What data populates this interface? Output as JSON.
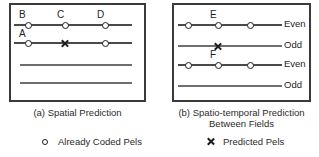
{
  "figure": {
    "colors": {
      "box_border": "#3a3a3a",
      "scanline": "#6e6e6e",
      "marker": "#1e1e1e",
      "text": "#2b2b2b",
      "background": "#ffffff"
    }
  },
  "panel_a": {
    "caption": "(a) Spatial Prediction",
    "scanlines": [
      {
        "id": "line-1",
        "x": 14,
        "y": 24,
        "width": 118
      },
      {
        "id": "line-2",
        "x": 14,
        "y": 42,
        "width": 118
      },
      {
        "id": "line-3",
        "x": 20,
        "y": 64,
        "width": 112
      },
      {
        "id": "line-4",
        "x": 20,
        "y": 82,
        "width": 112
      }
    ],
    "markers": [
      {
        "id": "marker-B",
        "type": "circle",
        "label": "B",
        "x": 25,
        "y": 25
      },
      {
        "id": "marker-C",
        "type": "circle",
        "label": "C",
        "x": 62,
        "y": 25
      },
      {
        "id": "marker-D",
        "type": "circle",
        "label": "D",
        "x": 102,
        "y": 25
      },
      {
        "id": "marker-A",
        "type": "circle",
        "label": "A",
        "x": 25,
        "y": 43
      },
      {
        "id": "marker-X",
        "type": "cross",
        "label": "",
        "x": 62,
        "y": 43
      },
      {
        "id": "marker-right",
        "type": "circle",
        "label": "",
        "x": 102,
        "y": 43
      }
    ]
  },
  "panel_b": {
    "caption": "(b) Spatio-temporal Prediction\nBetween Fields",
    "scanlines": [
      {
        "id": "line-1",
        "x": 178,
        "y": 24,
        "width": 104,
        "parity": "Even"
      },
      {
        "id": "line-2",
        "x": 178,
        "y": 45,
        "width": 104,
        "parity": "Odd"
      },
      {
        "id": "line-3",
        "x": 178,
        "y": 64,
        "width": 104,
        "parity": "Even"
      },
      {
        "id": "line-4",
        "x": 178,
        "y": 85,
        "width": 104,
        "parity": "Odd"
      }
    ],
    "field_labels": [
      {
        "id": "field-1",
        "text": "Even",
        "x": 285,
        "y": 19
      },
      {
        "id": "field-2",
        "text": "Odd",
        "x": 285,
        "y": 40
      },
      {
        "id": "field-3",
        "text": "Even",
        "x": 285,
        "y": 59
      },
      {
        "id": "field-4",
        "text": "Odd",
        "x": 285,
        "y": 80
      }
    ],
    "markers": [
      {
        "id": "marker-b1",
        "type": "circle",
        "label": "",
        "x": 188,
        "y": 25
      },
      {
        "id": "marker-E",
        "type": "circle",
        "label": "E",
        "x": 218,
        "y": 25
      },
      {
        "id": "marker-b3",
        "type": "circle",
        "label": "",
        "x": 250,
        "y": 25
      },
      {
        "id": "marker-X",
        "type": "cross",
        "label": "",
        "x": 218,
        "y": 46
      },
      {
        "id": "marker-b4",
        "type": "circle",
        "label": "",
        "x": 188,
        "y": 65
      },
      {
        "id": "marker-F",
        "type": "circle",
        "label": "F",
        "x": 218,
        "y": 65
      },
      {
        "id": "marker-b6",
        "type": "circle",
        "label": "",
        "x": 250,
        "y": 65
      }
    ]
  },
  "legend": {
    "coded": {
      "glyph": "circle-marker-icon",
      "text": "Already Coded Pels"
    },
    "predicted": {
      "glyph": "cross-marker-icon",
      "text": "Predicted Pels"
    }
  }
}
